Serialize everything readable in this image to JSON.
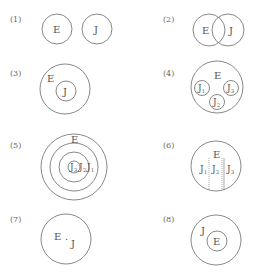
{
  "panels": [
    {
      "label": "(1)",
      "relation": "disjoint",
      "texts": {
        "e": "E",
        "j": "J"
      }
    },
    {
      "label": "(2)",
      "relation": "overlap",
      "texts": {
        "e": "E",
        "j": "J"
      }
    },
    {
      "label": "(3)",
      "relation": "J inside E",
      "texts": {
        "e": "E",
        "j": "J"
      }
    },
    {
      "label": "(4)",
      "relation": "multiple J inside E",
      "texts": {
        "e": "E",
        "j": "J",
        "s1": "1",
        "s2": "2",
        "s3": "3"
      }
    },
    {
      "label": "(5)",
      "relation": "nested concentric",
      "texts": {
        "e": "E",
        "j": "J",
        "s1": "1",
        "s2": "2",
        "s3": "3"
      }
    },
    {
      "label": "(6)",
      "relation": "partitioned E",
      "texts": {
        "e": "E",
        "j": "J",
        "s1": "1",
        "s2": "2",
        "s3": "3"
      }
    },
    {
      "label": "(7)",
      "relation": "E and J point in circle",
      "texts": {
        "e": "E",
        "dot": ".",
        "j": "J"
      }
    },
    {
      "label": "(8)",
      "relation": "E inside J",
      "texts": {
        "e": "E",
        "j": "J"
      }
    }
  ],
  "colors": {
    "stroke": "#7a7a7a",
    "text": "#555555"
  }
}
